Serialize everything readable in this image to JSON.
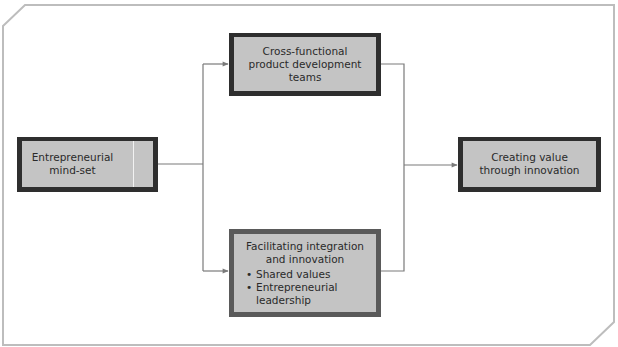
{
  "diagram": {
    "colors": {
      "frame": "#bdbdbd",
      "box_fill": "#c4c4c4",
      "box_border_dark": "#2e2e2e",
      "box_border_mid": "#5a5a5a",
      "connector": "#7a7a7a",
      "text": "#2a2a2a"
    },
    "nodes": {
      "entrepreneurial": {
        "lines": [
          "Entrepreneurial",
          "mind-set"
        ]
      },
      "cross_functional": {
        "lines": [
          "Cross-functional",
          "product development",
          "teams"
        ]
      },
      "facilitating": {
        "lines": [
          "Facilitating integration",
          "and innovation"
        ],
        "bullet_symbol": "•",
        "bullets": [
          {
            "lines": [
              "Shared values"
            ]
          },
          {
            "lines": [
              "Entrepreneurial",
              "leadership"
            ]
          }
        ]
      },
      "creating_value": {
        "lines": [
          "Creating value",
          "through innovation"
        ]
      }
    },
    "edges": [
      {
        "from": "entrepreneurial",
        "to": "cross_functional"
      },
      {
        "from": "entrepreneurial",
        "to": "facilitating"
      },
      {
        "from": "cross_functional",
        "to": "creating_value"
      },
      {
        "from": "facilitating",
        "to": "creating_value"
      }
    ]
  }
}
